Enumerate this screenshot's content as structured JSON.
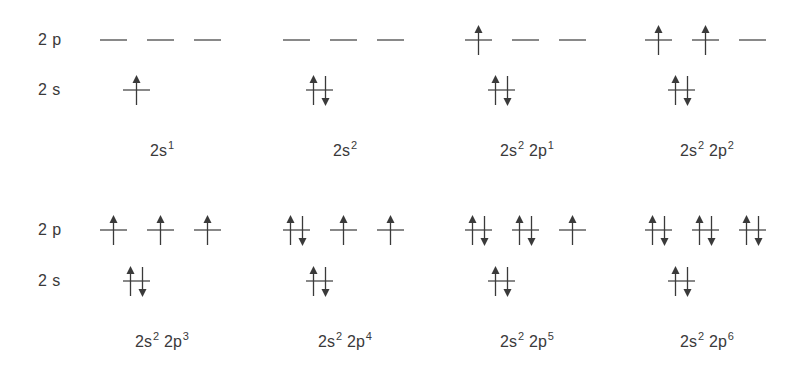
{
  "diagram": {
    "title": "",
    "colors": {
      "line": "#3a3a3a",
      "text": "#3a3a3a",
      "background": "#ffffff"
    },
    "row_labels": [
      {
        "row": 0,
        "p_label": "2 p",
        "s_label": "2 s"
      },
      {
        "row": 1,
        "p_label": "2 p",
        "s_label": "2 s"
      }
    ],
    "panels": [
      {
        "caption": [
          {
            "base": "2s",
            "sup": "1"
          }
        ],
        "row": 0,
        "col": 0,
        "s": 1,
        "p": [
          0,
          0,
          0
        ]
      },
      {
        "caption": [
          {
            "base": "2s",
            "sup": "2"
          }
        ],
        "row": 0,
        "col": 1,
        "s": 2,
        "p": [
          0,
          0,
          0
        ]
      },
      {
        "caption": [
          {
            "base": "2s",
            "sup": "2"
          },
          {
            "base": "2p",
            "sup": "1"
          }
        ],
        "row": 0,
        "col": 2,
        "s": 2,
        "p": [
          1,
          0,
          0
        ]
      },
      {
        "caption": [
          {
            "base": "2s",
            "sup": "2"
          },
          {
            "base": "2p",
            "sup": "2"
          }
        ],
        "row": 0,
        "col": 3,
        "s": 2,
        "p": [
          1,
          1,
          0
        ]
      },
      {
        "caption": [
          {
            "base": "2s",
            "sup": "2"
          },
          {
            "base": "2p",
            "sup": "3"
          }
        ],
        "row": 1,
        "col": 0,
        "s": 2,
        "p": [
          1,
          1,
          1
        ]
      },
      {
        "caption": [
          {
            "base": "2s",
            "sup": "2"
          },
          {
            "base": "2p",
            "sup": "4"
          }
        ],
        "row": 1,
        "col": 1,
        "s": 2,
        "p": [
          2,
          1,
          1
        ]
      },
      {
        "caption": [
          {
            "base": "2s",
            "sup": "2"
          },
          {
            "base": "2p",
            "sup": "5"
          }
        ],
        "row": 1,
        "col": 2,
        "s": 2,
        "p": [
          2,
          2,
          1
        ]
      },
      {
        "caption": [
          {
            "base": "2s",
            "sup": "2"
          },
          {
            "base": "2p",
            "sup": "6"
          }
        ],
        "row": 1,
        "col": 3,
        "s": 2,
        "p": [
          2,
          2,
          2
        ]
      }
    ]
  }
}
